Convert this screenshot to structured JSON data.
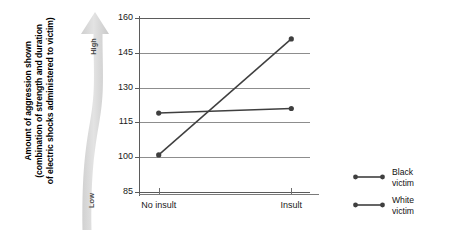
{
  "chart_data": {
    "type": "line",
    "title": "",
    "xlabel": "",
    "ylabel": "Amount of aggression shown (combination of strength and duration of electric shocks administered to victim)",
    "categories": [
      "No insult",
      "Insult"
    ],
    "series": [
      {
        "name": "Black victim",
        "values": [
          119,
          121
        ],
        "color": "#3f3f3f"
      },
      {
        "name": "White victim",
        "values": [
          101,
          151
        ],
        "color": "#3f3f3f"
      }
    ],
    "ylim": [
      85,
      160
    ],
    "yticks": [
      160,
      145,
      130,
      115,
      100,
      85
    ],
    "ytick_labels": [
      "160",
      "145",
      "130",
      "115",
      "100",
      "85"
    ],
    "grid": true,
    "legend_position": "right"
  },
  "ylabel_lines": [
    "Amount of aggression shown",
    "(combination of strength and duration",
    "of electric shocks administered to victim)"
  ],
  "axis_arrow": {
    "high_label": "High",
    "low_label": "Low",
    "color": "#d9d9d9"
  },
  "legend": {
    "items": [
      {
        "line1": "Black",
        "line2": "victim",
        "color": "#3f3f3f"
      },
      {
        "line1": "White",
        "line2": "victim",
        "color": "#3f3f3f"
      }
    ]
  },
  "colors": {
    "line": "#3f3f3f",
    "grid": "#8d8d8d",
    "axis": "#5b5b5b",
    "text": "#111111",
    "arrow_fill": "#d9d9d9"
  }
}
